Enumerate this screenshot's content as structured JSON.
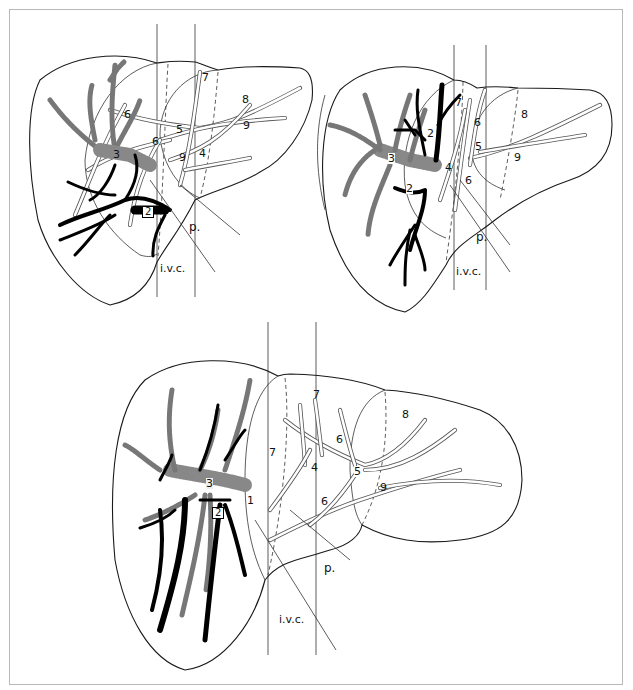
{
  "figure": {
    "type": "anatomical-diagram",
    "colors": {
      "outline": "#1a1a1a",
      "black_vessels": "#000000",
      "frame": "#b8b8b8",
      "background": "#ffffff"
    }
  },
  "views": [
    {
      "id": "top-left",
      "labels": [
        {
          "text": "7",
          "x": 202,
          "y": 72
        },
        {
          "text": "8",
          "x": 242,
          "y": 94
        },
        {
          "text": "6",
          "x": 124,
          "y": 109
        },
        {
          "text": "9",
          "x": 243,
          "y": 120
        },
        {
          "text": "5",
          "x": 176,
          "y": 124
        },
        {
          "text": "6",
          "x": 152,
          "y": 136
        },
        {
          "text": "3",
          "x": 113,
          "y": 149
        },
        {
          "text": "9",
          "x": 179,
          "y": 152
        },
        {
          "text": "4",
          "x": 199,
          "y": 148
        },
        {
          "text": "2",
          "x": 142,
          "y": 206,
          "boxed": true
        },
        {
          "text": "p.",
          "x": 189,
          "y": 221
        },
        {
          "text": "i.v.c.",
          "x": 156,
          "y": 263
        }
      ]
    },
    {
      "id": "top-right",
      "labels": [
        {
          "text": "7",
          "x": 455,
          "y": 97
        },
        {
          "text": "6",
          "x": 474,
          "y": 117
        },
        {
          "text": "8",
          "x": 521,
          "y": 109
        },
        {
          "text": "2",
          "x": 427,
          "y": 128
        },
        {
          "text": "5",
          "x": 475,
          "y": 141
        },
        {
          "text": "9",
          "x": 514,
          "y": 152
        },
        {
          "text": "3",
          "x": 388,
          "y": 153
        },
        {
          "text": "4",
          "x": 445,
          "y": 162
        },
        {
          "text": "6",
          "x": 465,
          "y": 175
        },
        {
          "text": "2",
          "x": 406,
          "y": 183
        },
        {
          "text": "p.",
          "x": 476,
          "y": 231
        },
        {
          "text": "i.v.c.",
          "x": 447,
          "y": 266
        }
      ]
    },
    {
      "id": "bottom",
      "labels": [
        {
          "text": "7",
          "x": 313,
          "y": 389
        },
        {
          "text": "8",
          "x": 402,
          "y": 409
        },
        {
          "text": "6",
          "x": 336,
          "y": 434
        },
        {
          "text": "7",
          "x": 269,
          "y": 447
        },
        {
          "text": "4",
          "x": 311,
          "y": 462
        },
        {
          "text": "5",
          "x": 354,
          "y": 466
        },
        {
          "text": "3",
          "x": 206,
          "y": 478
        },
        {
          "text": "9",
          "x": 380,
          "y": 482
        },
        {
          "text": "1",
          "x": 247,
          "y": 495
        },
        {
          "text": "6",
          "x": 321,
          "y": 496
        },
        {
          "text": "2",
          "x": 214,
          "y": 507,
          "boxed": true
        },
        {
          "text": "p.",
          "x": 324,
          "y": 562
        },
        {
          "text": "i.v.c.",
          "x": 277,
          "y": 614
        }
      ]
    }
  ]
}
